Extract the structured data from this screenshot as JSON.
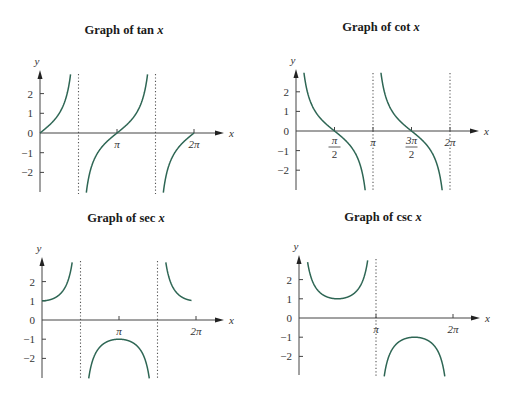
{
  "chart_data": [
    {
      "type": "line",
      "title": "Graph of tan x",
      "title_func": "tan",
      "function": "tan",
      "xlabel": "x",
      "ylabel": "y",
      "xlim": [
        0,
        6.2832
      ],
      "ylim": [
        -3,
        3
      ],
      "x_ticks": [
        {
          "value": 3.1416,
          "label": "π"
        },
        {
          "value": 6.2832,
          "label": "2π"
        }
      ],
      "y_ticks": [
        {
          "value": 2,
          "label": "2"
        },
        {
          "value": 1,
          "label": "1"
        },
        {
          "value": 0,
          "label": "0"
        },
        {
          "value": -1,
          "label": "−1"
        },
        {
          "value": -2,
          "label": "−2"
        }
      ],
      "asymptotes": [
        1.5708,
        4.7124
      ],
      "grid": false,
      "layout": {
        "ox": 40,
        "oy": 133,
        "px_per_pi": 77,
        "px_per_unit": 19.7,
        "axis_top": 70,
        "axis_bottom": 192,
        "axis_right": 224,
        "title_x": 124,
        "title_y": 24
      },
      "curve_color": "#2e6654"
    },
    {
      "type": "line",
      "title": "Graph of cot x",
      "title_func": "cot",
      "function": "cot",
      "xlabel": "x",
      "ylabel": "y",
      "xlim": [
        0,
        6.2832
      ],
      "ylim": [
        -3,
        3
      ],
      "x_ticks": [
        {
          "value": 1.5708,
          "label": "π/2",
          "frac": [
            "π",
            "2"
          ]
        },
        {
          "value": 3.1416,
          "label": "π"
        },
        {
          "value": 4.7124,
          "label": "3π/2",
          "frac": [
            "3π",
            "2"
          ]
        },
        {
          "value": 6.2832,
          "label": "2π"
        }
      ],
      "y_ticks": [
        {
          "value": 2,
          "label": "2"
        },
        {
          "value": 1,
          "label": "1"
        },
        {
          "value": 0,
          "label": "0"
        },
        {
          "value": -1,
          "label": "−1"
        },
        {
          "value": -2,
          "label": "−2"
        }
      ],
      "asymptotes": [
        3.1416,
        6.2832
      ],
      "grid": false,
      "layout": {
        "ox": 296,
        "oy": 131,
        "px_per_pi": 77,
        "px_per_unit": 19.6,
        "axis_top": 69,
        "axis_bottom": 190,
        "axis_right": 479,
        "title_x": 380,
        "title_y": 21
      },
      "curve_color": "#2e6654"
    },
    {
      "type": "line",
      "title": "Graph of sec x",
      "title_func": "sec",
      "function": "sec",
      "xlabel": "x",
      "ylabel": "y",
      "xlim": [
        0,
        6.2832
      ],
      "ylim": [
        -3,
        3
      ],
      "x_ticks": [
        {
          "value": 3.1416,
          "label": "π"
        },
        {
          "value": 6.2832,
          "label": "2π"
        }
      ],
      "y_ticks": [
        {
          "value": 2,
          "label": "2"
        },
        {
          "value": 1,
          "label": "1"
        },
        {
          "value": 0,
          "label": "0"
        },
        {
          "value": -1,
          "label": "−1"
        },
        {
          "value": -2,
          "label": "−2"
        }
      ],
      "asymptotes": [
        1.5708,
        4.7124
      ],
      "grid": false,
      "layout": {
        "ox": 42,
        "oy": 320,
        "px_per_pi": 77,
        "px_per_unit": 19.2,
        "axis_top": 257,
        "axis_bottom": 378,
        "axis_right": 224,
        "title_x": 126,
        "title_y": 212
      },
      "curve_color": "#2e6654"
    },
    {
      "type": "line",
      "title": "Graph of csc x",
      "title_func": "csc",
      "function": "csc",
      "xlabel": "x",
      "ylabel": "y",
      "xlim": [
        0,
        6.2832
      ],
      "ylim": [
        -3,
        3
      ],
      "x_ticks": [
        {
          "value": 3.1416,
          "label": "π"
        },
        {
          "value": 6.2832,
          "label": "2π"
        }
      ],
      "y_ticks": [
        {
          "value": 2,
          "label": "2"
        },
        {
          "value": 1,
          "label": "1"
        },
        {
          "value": 0,
          "label": "0"
        },
        {
          "value": -1,
          "label": "−1"
        },
        {
          "value": -2,
          "label": "−2"
        }
      ],
      "asymptotes": [
        3.1416
      ],
      "grid": false,
      "layout": {
        "ox": 299,
        "oy": 318,
        "px_per_pi": 77,
        "px_per_unit": 19.2,
        "axis_top": 255,
        "axis_bottom": 375,
        "axis_right": 480,
        "title_x": 382,
        "title_y": 211
      },
      "curve_color": "#2e6654"
    }
  ],
  "titles": {
    "tan": {
      "prefix": "Graph of ",
      "var": "tan x"
    },
    "cot": {
      "prefix": "Graph of ",
      "var": "cot x"
    },
    "sec": {
      "prefix": "Graph of ",
      "var": "sec x"
    },
    "csc": {
      "prefix": "Graph of ",
      "var": "csc x"
    }
  }
}
